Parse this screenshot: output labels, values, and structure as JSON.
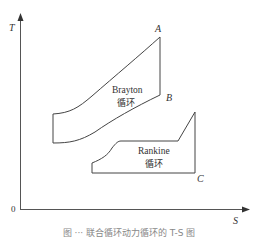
{
  "diagram": {
    "type": "T-S diagram",
    "axes": {
      "y_label": "T",
      "x_label": "S",
      "origin_label": "0"
    },
    "cycles": [
      {
        "name": "Brayton",
        "name_cn": "循环",
        "points": {
          "A": "A",
          "B": "B"
        }
      },
      {
        "name": "Rankine",
        "name_cn": "循环",
        "points": {
          "C": "C"
        }
      }
    ],
    "colors": {
      "line": "#444444",
      "text": "#333333"
    }
  },
  "caption": "图 ··· 联合循环动力循环的 T-S 图"
}
